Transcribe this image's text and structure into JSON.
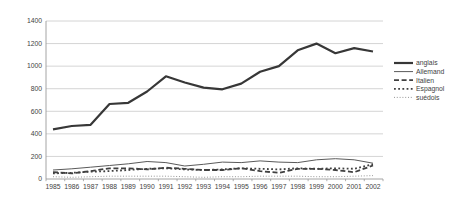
{
  "chart_data": {
    "type": "line",
    "title": "",
    "xlabel": "",
    "ylabel": "",
    "x": [
      "1985",
      "1986",
      "1987",
      "1988",
      "1989",
      "1990",
      "1991",
      "1992",
      "1993",
      "1994",
      "1995",
      "1996",
      "1997",
      "1998",
      "1999",
      "2000",
      "2001",
      "2002"
    ],
    "ylim": [
      0,
      1400
    ],
    "yticks": [
      0,
      200,
      400,
      600,
      800,
      1000,
      1200,
      1400
    ],
    "ytick_labels": [
      "0",
      "200",
      "400",
      "600",
      "800",
      "1000",
      "1200",
      "1400"
    ],
    "grid": "horizontal",
    "legend_position": "right",
    "series": [
      {
        "name": "anglais",
        "line_style": "solid-thick",
        "color": "#373737",
        "values": [
          440,
          470,
          480,
          665,
          675,
          775,
          910,
          855,
          810,
          795,
          845,
          950,
          1000,
          1140,
          1200,
          1115,
          1160,
          1130
        ]
      },
      {
        "name": "Allemand",
        "line_style": "solid-thin",
        "color": "#5a5a5a",
        "values": [
          80,
          90,
          105,
          120,
          135,
          155,
          145,
          115,
          130,
          150,
          145,
          160,
          150,
          145,
          170,
          180,
          170,
          140
        ]
      },
      {
        "name": "Italien",
        "line_style": "dashed",
        "color": "#404040",
        "values": [
          60,
          50,
          70,
          95,
          95,
          85,
          100,
          90,
          80,
          80,
          95,
          70,
          55,
          90,
          90,
          80,
          60,
          120
        ]
      },
      {
        "name": "Espagnol",
        "line_style": "square-dotted",
        "color": "#404040",
        "values": [
          50,
          55,
          65,
          70,
          80,
          90,
          95,
          85,
          80,
          85,
          95,
          90,
          85,
          95,
          90,
          95,
          90,
          130
        ]
      },
      {
        "name": "suédois",
        "line_style": "fine-dotted",
        "color": "#8a8a8a",
        "values": [
          20,
          15,
          20,
          25,
          25,
          25,
          25,
          20,
          15,
          20,
          20,
          25,
          25,
          25,
          20,
          20,
          25,
          30
        ]
      }
    ],
    "colors": {
      "gridline": "#c9c9c9",
      "axis": "#9a9a9a",
      "tick_text": "#3f3f3f",
      "background": "#ffffff"
    }
  }
}
